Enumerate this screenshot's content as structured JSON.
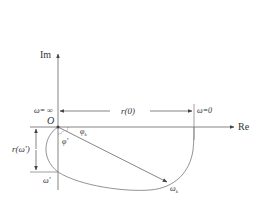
{
  "diagram": {
    "type": "nyquist-plot",
    "axes": {
      "imag_label": "Im",
      "real_label": "Re",
      "origin_label": "O"
    },
    "labels": {
      "omega_infinity": "ω= ∞",
      "omega_zero": "ω=0",
      "r0": "r(0)",
      "r_omega_prime": "r(ω′)",
      "omega_prime": "ω′",
      "phi_prime": "φ′",
      "phi_k": "φ",
      "phi_k_sub": "k",
      "omega_k": "ω",
      "omega_k_sub": "k"
    },
    "colors": {
      "line": "#555555",
      "text": "#333333",
      "background": "#ffffff"
    }
  }
}
